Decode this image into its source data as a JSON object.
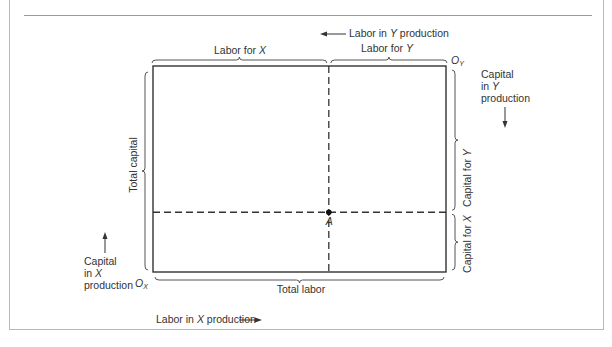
{
  "diagram": {
    "type": "edgeworth-box",
    "top_labels": {
      "labor_in_y_production": {
        "pre": "Labor in ",
        "var": "Y",
        "post": " production"
      },
      "labor_for_x": {
        "pre": "Labor for ",
        "var": "X"
      },
      "labor_for_y": {
        "pre": "Labor for ",
        "var": "Y"
      }
    },
    "origins": {
      "oy": {
        "main": "O",
        "sub": "Y"
      },
      "ox": {
        "main": "O",
        "sub": "X"
      }
    },
    "right_labels": {
      "capital_in_y_production": [
        "Capital",
        "in ",
        "Y",
        "production"
      ],
      "capital_for_y": {
        "pre": "Capital for ",
        "var": "Y"
      },
      "capital_for_x": {
        "pre": "Capital for ",
        "var": "X"
      }
    },
    "left_labels": {
      "total_capital": "Total capital",
      "capital_in_x_production": [
        "Capital",
        "in ",
        "X",
        "production"
      ]
    },
    "bottom_labels": {
      "total_labor": "Total labor",
      "labor_in_x_production": {
        "pre": "Labor in ",
        "var": "X",
        "post": " production"
      }
    },
    "point": {
      "label": "A",
      "labor_share_x": 0.6,
      "capital_share_x": 0.29
    },
    "colors": {
      "line": "#333333",
      "text": "#333333",
      "frame": "#b8b8b8"
    }
  }
}
